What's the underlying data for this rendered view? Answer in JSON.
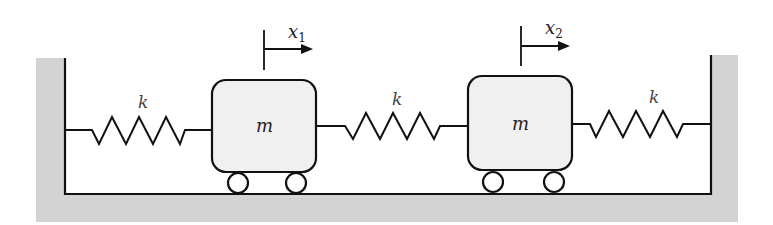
{
  "diagram": {
    "title": "",
    "springs": [
      {
        "label": "k"
      },
      {
        "label": "k"
      },
      {
        "label": "k"
      }
    ],
    "masses": [
      {
        "label": "m",
        "displacement_label": "x",
        "displacement_sub": "1"
      },
      {
        "label": "m",
        "displacement_label": "x",
        "displacement_sub": "2"
      }
    ],
    "colors": {
      "ground": "#d3d3d3",
      "mass_fill": "#f0f0f0",
      "stroke": "#111111"
    }
  }
}
